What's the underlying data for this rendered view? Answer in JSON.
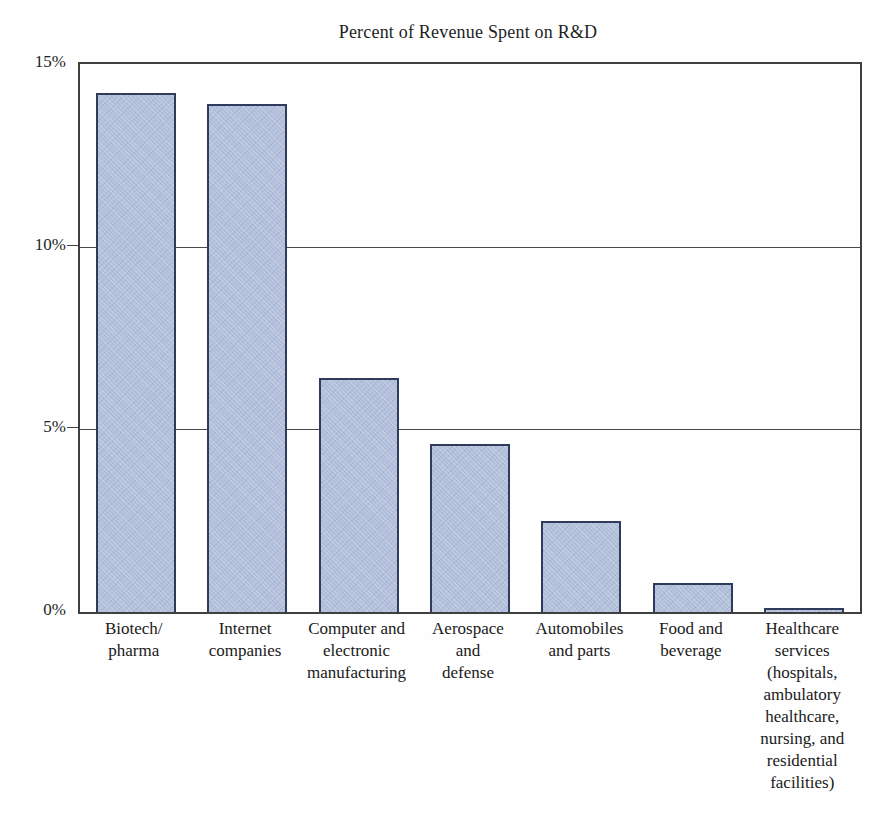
{
  "figure": {
    "background": "#fefefe"
  },
  "chart_data": {
    "type": "bar",
    "title": "Percent of Revenue Spent on R&D",
    "xlabel": "",
    "ylabel": "",
    "unit": "%",
    "categories": [
      "Biotech/\npharma",
      "Internet\ncompanies",
      "Computer and\nelectronic\nmanufacturing",
      "Aerospace\nand\ndefense",
      "Automobiles\nand parts",
      "Food and\nbeverage",
      "Healthcare\nservices\n(hospitals,\nambulatory\nhealthcare,\nnursing, and\nresidential\nfacilities)"
    ],
    "values": [
      14.2,
      13.9,
      6.4,
      4.6,
      2.5,
      0.8,
      0.1
    ],
    "ylim": [
      0,
      15
    ],
    "y_ticks": [
      {
        "value": 15,
        "label": "15%"
      },
      {
        "value": 10,
        "label": "10%"
      },
      {
        "value": 5,
        "label": "5%"
      },
      {
        "value": 0,
        "label": "0%"
      }
    ],
    "gridline_values": [
      10,
      5
    ],
    "grid": "horizontal",
    "legend_position": "none",
    "bar_fill_color": "#b2c0db",
    "bar_border_color": "#2e3b5a",
    "axis_color": "#3f3f3f",
    "grid_color": "#4a4a4a",
    "text_color": "#1c1c1c"
  }
}
